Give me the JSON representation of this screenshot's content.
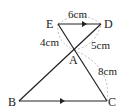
{
  "figure": {
    "points": {
      "E": {
        "label": "E",
        "x": 58,
        "y": 24
      },
      "D": {
        "label": "D",
        "x": 101,
        "y": 24
      },
      "A": {
        "label": "A",
        "x": 74,
        "y": 50
      },
      "B": {
        "label": "B",
        "x": 19,
        "y": 101
      },
      "C": {
        "label": "C",
        "x": 107,
        "y": 101
      }
    },
    "lengths": {
      "ED": "6cm",
      "EA": "4cm",
      "AD": "5cm",
      "AC": "8cm"
    },
    "parallel_marks": [
      "ED",
      "BC"
    ]
  }
}
